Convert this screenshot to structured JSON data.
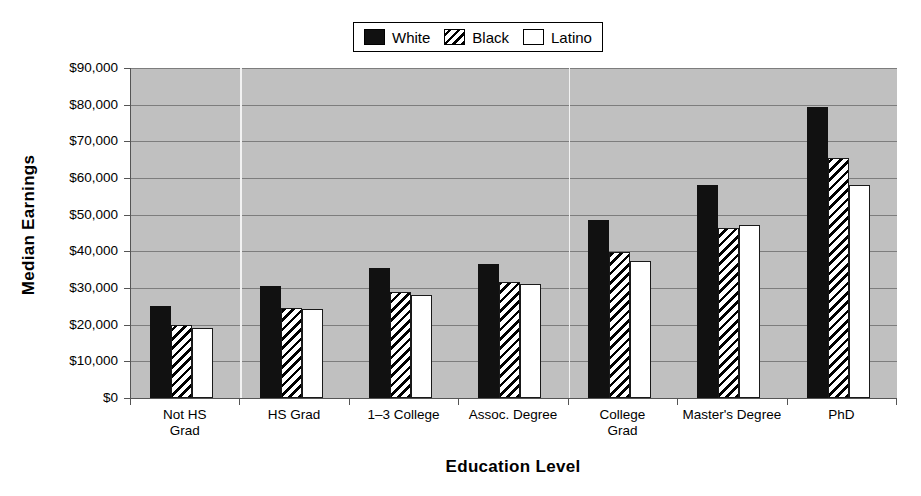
{
  "chart_data": {
    "type": "bar",
    "title": "",
    "xlabel": "Education Level",
    "ylabel": "Median Earnings",
    "categories": [
      "Not HS\nGrad",
      "HS Grad",
      "1–3 College",
      "Assoc. Degree",
      "College\nGrad",
      "Master's Degree",
      "PhD"
    ],
    "series": [
      {
        "name": "White",
        "pattern": "solid-black",
        "values": [
          25000,
          30500,
          35500,
          36500,
          48500,
          58000,
          79500
        ]
      },
      {
        "name": "Black",
        "pattern": "diagonal-hatch",
        "values": [
          19800,
          24500,
          28800,
          31700,
          39700,
          46300,
          65500
        ]
      },
      {
        "name": "Latino",
        "pattern": "white-empty",
        "values": [
          19000,
          24200,
          28000,
          31200,
          37500,
          47300,
          58200
        ]
      }
    ],
    "ylim": [
      0,
      90000
    ],
    "ytick_values": [
      0,
      10000,
      20000,
      30000,
      40000,
      50000,
      60000,
      70000,
      80000,
      90000
    ],
    "ytick_labels": [
      "$0",
      "$10,000",
      "$20,000",
      "$30,000",
      "$40,000",
      "$50,000",
      "$60,000",
      "$70,000",
      "$80,000",
      "$90,000"
    ],
    "grid": true,
    "legend_position": "top-center",
    "plot_background_color": "#c0c0c0",
    "gridline_color": "#7d7d7d",
    "category_separator_color": "#f2f2f2",
    "category_separators_after": [
      0,
      3
    ]
  },
  "legend": {
    "entries": [
      {
        "label": "White",
        "swatch": "sw-solid"
      },
      {
        "label": "Black",
        "swatch": "sw-hatch"
      },
      {
        "label": "Latino",
        "swatch": "sw-empty"
      }
    ]
  }
}
